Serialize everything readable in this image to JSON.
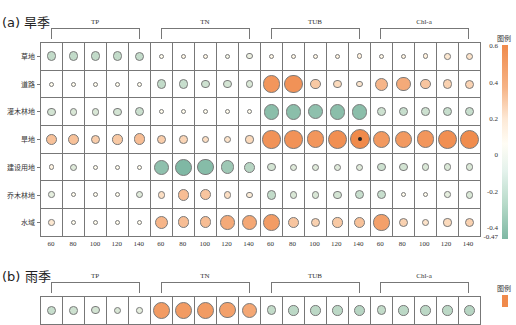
{
  "chart_data": [
    {
      "type": "bubble-heatmap",
      "title": "(a) 旱季",
      "groups": [
        "TP",
        "TN",
        "TUB",
        "Chl-a"
      ],
      "x_ticks": [
        "60",
        "80",
        "100",
        "120",
        "140",
        "60",
        "80",
        "100",
        "120",
        "140",
        "60",
        "80",
        "100",
        "120",
        "140",
        "60",
        "80",
        "100",
        "120",
        "140"
      ],
      "rows": [
        "草地",
        "道路",
        "灌木林地",
        "旱地",
        "建设用地",
        "乔木林地",
        "水域"
      ],
      "legend_title": "图例",
      "colorbar_ticks": [
        "0.6",
        "0.4",
        "0.2",
        "0",
        "-0.2",
        "-0.4",
        "-0.47"
      ],
      "colorbar_range": [
        -0.47,
        0.6
      ],
      "colors": {
        "positive": "#f08a4b",
        "zero": "#fffbec",
        "negative": "#7fb8a4"
      },
      "values": [
        [
          -0.18,
          -0.18,
          -0.18,
          -0.18,
          -0.17,
          0.0,
          0.01,
          0.01,
          -0.02,
          -0.04,
          0.01,
          0.01,
          0.01,
          0.02,
          0.03,
          0.01,
          0.02,
          0.03,
          0.06,
          0.08
        ],
        [
          0.0,
          0.0,
          0.0,
          0.0,
          0.0,
          -0.18,
          -0.16,
          -0.14,
          -0.12,
          -0.1,
          0.48,
          0.5,
          0.2,
          0.12,
          0.07,
          0.3,
          0.36,
          0.22,
          0.16,
          0.15
        ],
        [
          -0.12,
          -0.1,
          -0.1,
          -0.12,
          -0.15,
          0.0,
          0.0,
          0.0,
          0.0,
          0.0,
          -0.4,
          -0.4,
          -0.38,
          -0.4,
          -0.4,
          -0.14,
          -0.16,
          -0.14,
          -0.16,
          -0.16
        ],
        [
          0.24,
          0.24,
          0.18,
          0.2,
          0.26,
          0.18,
          0.14,
          0.1,
          0.08,
          0.12,
          0.5,
          0.5,
          0.48,
          0.52,
          0.56,
          0.46,
          0.46,
          0.48,
          0.52,
          0.54
        ],
        [
          0.02,
          -0.08,
          0.0,
          0.0,
          0.0,
          -0.38,
          -0.45,
          -0.42,
          -0.32,
          -0.22,
          -0.12,
          -0.08,
          -0.08,
          -0.08,
          -0.08,
          -0.14,
          -0.12,
          -0.1,
          -0.1,
          -0.1
        ],
        [
          -0.06,
          0.0,
          0.0,
          0.0,
          -0.08,
          0.1,
          0.26,
          0.22,
          0.1,
          0.04,
          -0.18,
          -0.1,
          -0.1,
          -0.12,
          -0.16,
          -0.16,
          0.0,
          0.0,
          -0.06,
          -0.1
        ],
        [
          0.06,
          0.0,
          0.0,
          0.0,
          0.0,
          0.3,
          0.26,
          0.26,
          0.36,
          0.38,
          0.44,
          0.22,
          0.16,
          0.2,
          0.24,
          0.42,
          0.16,
          0.08,
          0.12,
          0.16
        ]
      ],
      "significant": [
        [
          3,
          14
        ]
      ]
    },
    {
      "type": "bubble-heatmap",
      "title": "(b) 雨季",
      "groups": [
        "TP",
        "TN",
        "TUB",
        "Chl-a"
      ],
      "legend_title": "图例",
      "first_row_partial": [
        -0.16,
        -0.14,
        -0.12,
        -0.1,
        -0.06,
        0.45,
        0.45,
        0.45,
        0.42,
        0.38,
        -0.18,
        -0.2,
        -0.2,
        -0.2,
        -0.22,
        -0.18,
        -0.2,
        -0.2,
        -0.2,
        -0.22
      ]
    }
  ],
  "panel_a": {
    "title": "(a) 旱季",
    "groups": [
      {
        "label": "TP"
      },
      {
        "label": "TN"
      },
      {
        "label": "TUB"
      },
      {
        "label": "Chl-a"
      }
    ],
    "rows": [
      "草地",
      "道路",
      "灌木林地",
      "旱地",
      "建设用地",
      "乔木林地",
      "水域"
    ],
    "x_ticks": [
      "60",
      "80",
      "100",
      "120",
      "140",
      "60",
      "80",
      "100",
      "120",
      "140",
      "60",
      "80",
      "100",
      "120",
      "140",
      "60",
      "80",
      "100",
      "120",
      "140"
    ],
    "legend_title": "图例",
    "colorbar_ticks": [
      {
        "label": "0.6",
        "y": 47
      },
      {
        "label": "0.4",
        "y": 84
      },
      {
        "label": "0.2",
        "y": 120
      },
      {
        "label": "0",
        "y": 156
      },
      {
        "label": "-0.2",
        "y": 193
      },
      {
        "label": "-0.4",
        "y": 229
      },
      {
        "label": "-0.47",
        "y": 238
      }
    ]
  },
  "panel_b": {
    "title": "(b) 雨季",
    "groups": [
      {
        "label": "TP"
      },
      {
        "label": "TN"
      },
      {
        "label": "TUB"
      },
      {
        "label": "Chl-a"
      }
    ],
    "legend_title": "图例"
  }
}
